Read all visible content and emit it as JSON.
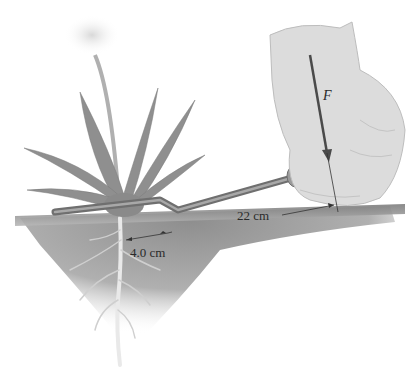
{
  "figure": {
    "labels": {
      "force": "F",
      "long_arm": "22 cm",
      "short_arm": "4.0 cm"
    },
    "colors": {
      "ground": "#8a8a8a",
      "soil": "#9a9a9a",
      "plant": "#8c8c8c",
      "hand": "#d6d6d6",
      "tool": "#7a7a7a",
      "lines": "#333333",
      "background": "#ffffff"
    }
  }
}
